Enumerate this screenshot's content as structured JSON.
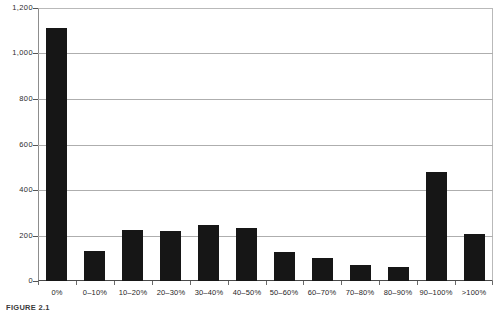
{
  "chart_data": {
    "type": "bar",
    "title": "",
    "subtitle": "",
    "xlabel": "",
    "ylabel": "",
    "categories": [
      "0%",
      "0–10%",
      "10–20%",
      "20–30%",
      "30–40%",
      "40–50%",
      "50–60%",
      "60–70%",
      "70–80%",
      "80–90%",
      "90–100%",
      ">100%"
    ],
    "values": [
      1112,
      130,
      222,
      218,
      248,
      233,
      128,
      103,
      72,
      60,
      478,
      205
    ],
    "ylim": [
      0,
      1200
    ],
    "yticks": [
      0,
      200,
      400,
      600,
      800,
      1000,
      1200
    ],
    "ytick_labels": [
      "0",
      "200",
      "400",
      "600",
      "800",
      "1,000",
      "1,200"
    ],
    "grid": true,
    "legend": false,
    "bar_color": "#161616",
    "grid_color": "#aeaeae",
    "axis_color": "#4a4a4a",
    "background": "#ffffff"
  },
  "caption": {
    "text": "FIGURE 2.1"
  }
}
